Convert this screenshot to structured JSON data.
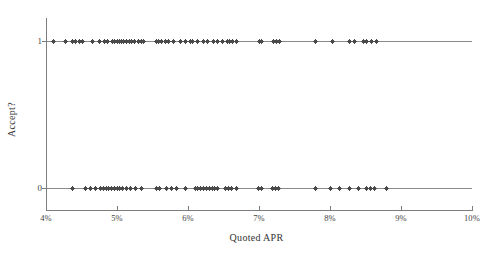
{
  "chart_data": {
    "type": "scatter",
    "title": "",
    "xlabel": "Quoted APR",
    "ylabel": "Accept?",
    "xlim": [
      4,
      10
    ],
    "ylim": [
      0,
      1
    ],
    "grid": false,
    "legend": null,
    "x_tick_labels": [
      "4%",
      "5%",
      "6%",
      "7%",
      "8%",
      "9%",
      "10%"
    ],
    "x_tick_values": [
      4,
      5,
      6,
      7,
      8,
      9,
      10
    ],
    "y_tick_labels": [
      "0",
      "1"
    ],
    "y_tick_values": [
      0,
      1
    ],
    "marker": "plus",
    "marker_color": "#4a4a4a",
    "series": [
      {
        "name": "Accepted",
        "y": 1,
        "x": [
          4.1,
          4.27,
          4.37,
          4.42,
          4.47,
          4.52,
          4.65,
          4.76,
          4.82,
          4.87,
          4.93,
          4.97,
          5.0,
          5.03,
          5.06,
          5.09,
          5.13,
          5.17,
          5.21,
          5.25,
          5.3,
          5.34,
          5.38,
          5.55,
          5.59,
          5.63,
          5.68,
          5.72,
          5.8,
          5.9,
          5.97,
          6.03,
          6.07,
          6.14,
          6.22,
          6.27,
          6.36,
          6.41,
          6.48,
          6.55,
          6.59,
          6.63,
          6.69,
          7.0,
          7.04,
          7.21,
          7.25,
          7.29,
          7.8,
          8.03,
          8.27,
          8.34,
          8.47,
          8.52,
          8.58,
          8.66
        ]
      },
      {
        "name": "Rejected",
        "y": 0,
        "x": [
          4.38,
          4.55,
          4.62,
          4.7,
          4.77,
          4.81,
          4.85,
          4.88,
          4.92,
          4.96,
          5.0,
          5.04,
          5.08,
          5.13,
          5.19,
          5.26,
          5.34,
          5.55,
          5.6,
          5.7,
          5.77,
          5.84,
          5.97,
          6.1,
          6.14,
          6.18,
          6.22,
          6.26,
          6.3,
          6.34,
          6.38,
          6.42,
          6.53,
          6.57,
          6.61,
          6.68,
          6.99,
          7.04,
          7.19,
          7.23,
          7.27,
          7.8,
          8.0,
          8.14,
          8.28,
          8.4,
          8.52,
          8.57,
          8.63,
          8.79
        ]
      }
    ]
  },
  "axes": {
    "x_title": "Quoted APR",
    "y_title": "Accept?"
  }
}
